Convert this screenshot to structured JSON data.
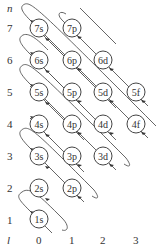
{
  "axes": {
    "n_label": "n",
    "l_label": "l",
    "n_values": [
      "7",
      "6",
      "5",
      "4",
      "3",
      "2",
      "1"
    ],
    "l_values": [
      "0",
      "1",
      "2",
      "3"
    ]
  },
  "orbitals": [
    {
      "label": "7s",
      "n": 7,
      "l": 0
    },
    {
      "label": "7p",
      "n": 7,
      "l": 1
    },
    {
      "label": "6s",
      "n": 6,
      "l": 0
    },
    {
      "label": "6p",
      "n": 6,
      "l": 1
    },
    {
      "label": "6d",
      "n": 6,
      "l": 2
    },
    {
      "label": "5s",
      "n": 5,
      "l": 0
    },
    {
      "label": "5p",
      "n": 5,
      "l": 1
    },
    {
      "label": "5d",
      "n": 5,
      "l": 2
    },
    {
      "label": "5f",
      "n": 5,
      "l": 3
    },
    {
      "label": "4s",
      "n": 4,
      "l": 0
    },
    {
      "label": "4p",
      "n": 4,
      "l": 1
    },
    {
      "label": "4d",
      "n": 4,
      "l": 2
    },
    {
      "label": "4f",
      "n": 4,
      "l": 3
    },
    {
      "label": "3s",
      "n": 3,
      "l": 0
    },
    {
      "label": "3p",
      "n": 3,
      "l": 1
    },
    {
      "label": "3d",
      "n": 3,
      "l": 2
    },
    {
      "label": "2s",
      "n": 2,
      "l": 0
    },
    {
      "label": "2p",
      "n": 2,
      "l": 1
    },
    {
      "label": "1s",
      "n": 1,
      "l": 0
    }
  ],
  "colors": {
    "stroke": "#444444",
    "text": "#333333",
    "background": "#ffffff"
  }
}
